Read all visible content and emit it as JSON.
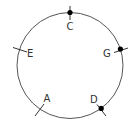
{
  "diagram": {
    "circle": {
      "cx": 70,
      "cy": 65.5,
      "r": 53,
      "stroke": "#555555"
    },
    "points": [
      {
        "id": "C",
        "label": "C",
        "angle_deg": 90,
        "dot": true,
        "label_x": 70,
        "label_y": 30
      },
      {
        "id": "G",
        "label": "G",
        "angle_deg": 18,
        "dot": true,
        "label_x": 107,
        "label_y": 57
      },
      {
        "id": "D",
        "label": "D",
        "angle_deg": -54,
        "dot": true,
        "label_x": 93,
        "label_y": 103
      },
      {
        "id": "A",
        "label": "A",
        "angle_deg": -126,
        "dot": false,
        "label_x": 47,
        "label_y": 102
      },
      {
        "id": "E",
        "label": "E",
        "angle_deg": 162,
        "dot": false,
        "label_x": 30,
        "label_y": 57
      }
    ]
  }
}
